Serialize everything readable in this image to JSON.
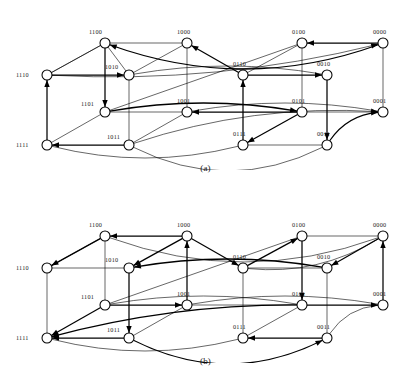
{
  "figure": {
    "type": "directed-hypercube-graph",
    "node_radius_px": 5.0,
    "colors": {
      "background": "#ffffff",
      "edge": "#000000",
      "node_stroke": "#000000",
      "node_fill": "#ffffff",
      "label_text": "#1a1a1a"
    }
  },
  "panels": [
    {
      "id": "a",
      "caption": "(a)",
      "nodes": [
        {
          "id": "1100",
          "label": "1100",
          "x": 105,
          "y": 43,
          "label_dx": -16,
          "label_dy": -9
        },
        {
          "id": "1000",
          "label": "1000",
          "x": 187,
          "y": 43,
          "label_dx": -10,
          "label_dy": -9
        },
        {
          "id": "0100",
          "label": "0100",
          "x": 302,
          "y": 43,
          "label_dx": -10,
          "label_dy": -9
        },
        {
          "id": "0000",
          "label": "0000",
          "x": 383,
          "y": 43,
          "label_dx": -10,
          "label_dy": -9
        },
        {
          "id": "1110",
          "label": "1110",
          "x": 47,
          "y": 75,
          "label_dx": -31,
          "label_dy": 2
        },
        {
          "id": "1010",
          "label": "1010",
          "x": 129,
          "y": 75,
          "label_dx": -24,
          "label_dy": -6
        },
        {
          "id": "0110",
          "label": "0110",
          "x": 243,
          "y": 75,
          "label_dx": -10,
          "label_dy": -9
        },
        {
          "id": "0010",
          "label": "0010",
          "x": 327,
          "y": 75,
          "label_dx": -10,
          "label_dy": -9
        },
        {
          "id": "1101",
          "label": "1101",
          "x": 105,
          "y": 112,
          "label_dx": -24,
          "label_dy": -6
        },
        {
          "id": "1001",
          "label": "1001",
          "x": 187,
          "y": 112,
          "label_dx": -10,
          "label_dy": -9
        },
        {
          "id": "0101",
          "label": "0101",
          "x": 302,
          "y": 112,
          "label_dx": -10,
          "label_dy": -9
        },
        {
          "id": "0001",
          "label": "0001",
          "x": 383,
          "y": 112,
          "label_dx": -10,
          "label_dy": -9
        },
        {
          "id": "1111",
          "label": "1111",
          "x": 47,
          "y": 145,
          "label_dx": -31,
          "label_dy": 2
        },
        {
          "id": "1011",
          "label": "1011",
          "x": 129,
          "y": 145,
          "label_dx": -22,
          "label_dy": -6
        },
        {
          "id": "0111",
          "label": "0111",
          "x": 243,
          "y": 145,
          "label_dx": -10,
          "label_dy": -9
        },
        {
          "id": "0011",
          "label": "0011",
          "x": 327,
          "y": 145,
          "label_dx": -10,
          "label_dy": -9
        }
      ],
      "edges": [
        {
          "from": "0000",
          "to": "1100",
          "curve": -26,
          "arrow": "to",
          "weight": "thick"
        },
        {
          "from": "0000",
          "to": "0100",
          "curve": 0,
          "arrow": "to",
          "weight": "thick"
        },
        {
          "from": "0000",
          "to": "1110",
          "curve": -13,
          "arrow": "from",
          "weight": "thin"
        },
        {
          "from": "0000",
          "to": "0001",
          "curve": 0,
          "arrow": "none",
          "weight": "thin"
        },
        {
          "from": "1100",
          "to": "1000",
          "curve": 0,
          "arrow": "none",
          "weight": "thin"
        },
        {
          "from": "1100",
          "to": "1110",
          "curve": 0,
          "arrow": "none",
          "weight": "thin"
        },
        {
          "from": "1100",
          "to": "1101",
          "curve": 0,
          "arrow": "to",
          "weight": "thick"
        },
        {
          "from": "1000",
          "to": "0110",
          "curve": 0,
          "arrow": "from",
          "weight": "thick"
        },
        {
          "from": "1000",
          "to": "1010",
          "curve": 0,
          "arrow": "none",
          "weight": "thin"
        },
        {
          "from": "1000",
          "to": "1001",
          "curve": 0,
          "arrow": "none",
          "weight": "thin"
        },
        {
          "from": "0100",
          "to": "0110",
          "curve": 0,
          "arrow": "none",
          "weight": "thin"
        },
        {
          "from": "0100",
          "to": "0101",
          "curve": 0,
          "arrow": "none",
          "weight": "thin"
        },
        {
          "from": "0100",
          "to": "1101",
          "curve": 0,
          "arrow": "none",
          "weight": "thin"
        },
        {
          "from": "1110",
          "to": "1010",
          "curve": 0,
          "arrow": "to",
          "weight": "thick"
        },
        {
          "from": "1110",
          "to": "1111",
          "curve": 0,
          "arrow": "from",
          "weight": "thick"
        },
        {
          "from": "1010",
          "to": "1011",
          "curve": 0,
          "arrow": "none",
          "weight": "thin"
        },
        {
          "from": "1010",
          "to": "0010",
          "curve": -9,
          "arrow": "none",
          "weight": "thin"
        },
        {
          "from": "0110",
          "to": "0010",
          "curve": 0,
          "arrow": "to",
          "weight": "thick"
        },
        {
          "from": "0110",
          "to": "0111",
          "curve": 0,
          "arrow": "from",
          "weight": "thick"
        },
        {
          "from": "0010",
          "to": "0011",
          "curve": 0,
          "arrow": "to",
          "weight": "thick"
        },
        {
          "from": "1101",
          "to": "1001",
          "curve": 0,
          "arrow": "none",
          "weight": "thin"
        },
        {
          "from": "1101",
          "to": "1111",
          "curve": 0,
          "arrow": "none",
          "weight": "thin"
        },
        {
          "from": "1101",
          "to": "0101",
          "curve": -9,
          "arrow": "to",
          "weight": "thick"
        },
        {
          "from": "1001",
          "to": "1011",
          "curve": 0,
          "arrow": "none",
          "weight": "thin"
        },
        {
          "from": "1001",
          "to": "0001",
          "curve": -9,
          "arrow": "none",
          "weight": "thin"
        },
        {
          "from": "1001",
          "to": "0101",
          "curve": 0,
          "arrow": "from",
          "weight": "thick"
        },
        {
          "from": "0101",
          "to": "0111",
          "curve": 0,
          "arrow": "to",
          "weight": "thick"
        },
        {
          "from": "0101",
          "to": "0001",
          "curve": 0,
          "arrow": "none",
          "weight": "thin"
        },
        {
          "from": "0001",
          "to": "1011",
          "curve": 13,
          "arrow": "from",
          "weight": "thin"
        },
        {
          "from": "0001",
          "to": "0011",
          "curve": 9,
          "arrow": "from",
          "weight": "thick"
        },
        {
          "from": "1111",
          "to": "1011",
          "curve": 0,
          "arrow": "from",
          "weight": "thick"
        },
        {
          "from": "1111",
          "to": "0111",
          "curve": 13,
          "arrow": "none",
          "weight": "thin"
        },
        {
          "from": "1011",
          "to": "0011",
          "curve": 26,
          "arrow": "none",
          "weight": "thin"
        },
        {
          "from": "0111",
          "to": "0011",
          "curve": 0,
          "arrow": "none",
          "weight": "thin"
        },
        {
          "from": "1100",
          "to": "1010",
          "curve": 0,
          "arrow": "none",
          "weight": "thin"
        },
        {
          "from": "1110",
          "to": "1100",
          "curve": 0,
          "arrow": "none",
          "weight": "thin"
        }
      ]
    },
    {
      "id": "b",
      "caption": "(b)",
      "nodes": [
        {
          "id": "1100",
          "label": "1100",
          "x": 105,
          "y": 43,
          "label_dx": -16,
          "label_dy": -9
        },
        {
          "id": "1000",
          "label": "1000",
          "x": 187,
          "y": 43,
          "label_dx": -10,
          "label_dy": -9
        },
        {
          "id": "0100",
          "label": "0100",
          "x": 302,
          "y": 43,
          "label_dx": -10,
          "label_dy": -9
        },
        {
          "id": "0000",
          "label": "0000",
          "x": 383,
          "y": 43,
          "label_dx": -10,
          "label_dy": -9
        },
        {
          "id": "1110",
          "label": "1110",
          "x": 47,
          "y": 75,
          "label_dx": -31,
          "label_dy": 2
        },
        {
          "id": "1010",
          "label": "1010",
          "x": 129,
          "y": 75,
          "label_dx": -24,
          "label_dy": -6
        },
        {
          "id": "0110",
          "label": "0110",
          "x": 243,
          "y": 75,
          "label_dx": -10,
          "label_dy": -9
        },
        {
          "id": "0010",
          "label": "0010",
          "x": 327,
          "y": 75,
          "label_dx": -10,
          "label_dy": -9
        },
        {
          "id": "1101",
          "label": "1101",
          "x": 105,
          "y": 112,
          "label_dx": -24,
          "label_dy": -6
        },
        {
          "id": "1001",
          "label": "1001",
          "x": 187,
          "y": 112,
          "label_dx": -10,
          "label_dy": -9
        },
        {
          "id": "0101",
          "label": "0101",
          "x": 302,
          "y": 112,
          "label_dx": -10,
          "label_dy": -9
        },
        {
          "id": "0001",
          "label": "0001",
          "x": 383,
          "y": 112,
          "label_dx": -10,
          "label_dy": -9
        },
        {
          "id": "1111",
          "label": "1111",
          "x": 47,
          "y": 145,
          "label_dx": -31,
          "label_dy": 2
        },
        {
          "id": "1011",
          "label": "1011",
          "x": 129,
          "y": 145,
          "label_dx": -22,
          "label_dy": -6
        },
        {
          "id": "0111",
          "label": "0111",
          "x": 243,
          "y": 145,
          "label_dx": -10,
          "label_dy": -9
        },
        {
          "id": "0011",
          "label": "0011",
          "x": 327,
          "y": 145,
          "label_dx": -10,
          "label_dy": -9
        }
      ],
      "edges": [
        {
          "from": "0000",
          "to": "1100",
          "curve": -26,
          "arrow": "none",
          "weight": "thin"
        },
        {
          "from": "0000",
          "to": "0100",
          "curve": 0,
          "arrow": "none",
          "weight": "thin"
        },
        {
          "from": "0000",
          "to": "0010",
          "curve": 0,
          "arrow": "to",
          "weight": "thick"
        },
        {
          "from": "0000",
          "to": "0001",
          "curve": 0,
          "arrow": "from",
          "weight": "thick"
        },
        {
          "from": "0000",
          "to": "0110",
          "curve": -13,
          "arrow": "none",
          "weight": "thin"
        },
        {
          "from": "1000",
          "to": "1100",
          "curve": 0,
          "arrow": "to",
          "weight": "thick"
        },
        {
          "from": "1000",
          "to": "1010",
          "curve": 0,
          "arrow": "to",
          "weight": "thick"
        },
        {
          "from": "1000",
          "to": "1001",
          "curve": 0,
          "arrow": "from",
          "weight": "thick"
        },
        {
          "from": "1000",
          "to": "0110",
          "curve": 0,
          "arrow": "to",
          "weight": "thick"
        },
        {
          "from": "1100",
          "to": "1110",
          "curve": 0,
          "arrow": "to",
          "weight": "thick"
        },
        {
          "from": "1100",
          "to": "1101",
          "curve": 0,
          "arrow": "none",
          "weight": "thin"
        },
        {
          "from": "0100",
          "to": "0110",
          "curve": 0,
          "arrow": "from",
          "weight": "thick"
        },
        {
          "from": "0100",
          "to": "0101",
          "curve": 0,
          "arrow": "to",
          "weight": "thick"
        },
        {
          "from": "0100",
          "to": "1101",
          "curve": 0,
          "arrow": "none",
          "weight": "thin"
        },
        {
          "from": "1110",
          "to": "1010",
          "curve": 0,
          "arrow": "none",
          "weight": "thin"
        },
        {
          "from": "1110",
          "to": "1111",
          "curve": 0,
          "arrow": "none",
          "weight": "thin"
        },
        {
          "from": "1010",
          "to": "1011",
          "curve": 0,
          "arrow": "to",
          "weight": "thick"
        },
        {
          "from": "1010",
          "to": "0010",
          "curve": -9,
          "arrow": "from",
          "weight": "thick"
        },
        {
          "from": "0110",
          "to": "0010",
          "curve": 0,
          "arrow": "none",
          "weight": "thin"
        },
        {
          "from": "0110",
          "to": "0111",
          "curve": 0,
          "arrow": "none",
          "weight": "thin"
        },
        {
          "from": "0010",
          "to": "0011",
          "curve": 0,
          "arrow": "none",
          "weight": "thin"
        },
        {
          "from": "1101",
          "to": "1001",
          "curve": 0,
          "arrow": "to",
          "weight": "thick"
        },
        {
          "from": "1101",
          "to": "1111",
          "curve": 0,
          "arrow": "to",
          "weight": "thick"
        },
        {
          "from": "1101",
          "to": "0101",
          "curve": -9,
          "arrow": "none",
          "weight": "thin"
        },
        {
          "from": "1001",
          "to": "1011",
          "curve": 0,
          "arrow": "none",
          "weight": "thin"
        },
        {
          "from": "1001",
          "to": "0001",
          "curve": -9,
          "arrow": "none",
          "weight": "thin"
        },
        {
          "from": "0101",
          "to": "0001",
          "curve": 0,
          "arrow": "to",
          "weight": "thick"
        },
        {
          "from": "0101",
          "to": "0111",
          "curve": 0,
          "arrow": "none",
          "weight": "thin"
        },
        {
          "from": "0101",
          "to": "1111",
          "curve": 9,
          "arrow": "to",
          "weight": "thick"
        },
        {
          "from": "0001",
          "to": "0011",
          "curve": 9,
          "arrow": "none",
          "weight": "thin"
        },
        {
          "from": "1111",
          "to": "1011",
          "curve": 0,
          "arrow": "from",
          "weight": "thick"
        },
        {
          "from": "1111",
          "to": "0111",
          "curve": 13,
          "arrow": "none",
          "weight": "thin"
        },
        {
          "from": "1011",
          "to": "0011",
          "curve": 26,
          "arrow": "to",
          "weight": "thick"
        },
        {
          "from": "0111",
          "to": "0011",
          "curve": 0,
          "arrow": "from",
          "weight": "thick"
        },
        {
          "from": "1001",
          "to": "0101",
          "curve": 0,
          "arrow": "none",
          "weight": "thin"
        },
        {
          "from": "1110",
          "to": "1100",
          "curve": 0,
          "arrow": "none",
          "weight": "thin"
        }
      ]
    }
  ]
}
